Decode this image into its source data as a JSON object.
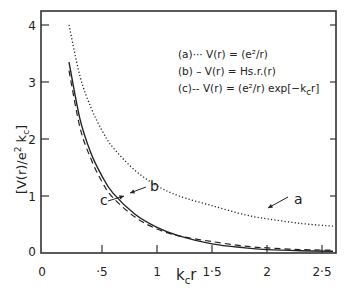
{
  "chart_data": {
    "type": "line",
    "title": "",
    "xlabel": "k_c r",
    "ylabel": "[V(r)/e² k_c]",
    "xlim": [
      0,
      2.63
    ],
    "ylim": [
      0,
      4.3
    ],
    "x_ticks": [
      0,
      0.5,
      1,
      1.5,
      2,
      2.5
    ],
    "x_tick_labels": [
      "0",
      "·5",
      "1",
      "1·5",
      "2",
      "2·5"
    ],
    "y_ticks": [
      0,
      1,
      2,
      3,
      4
    ],
    "y_tick_labels": [
      "0",
      "1",
      "2",
      "3",
      "4"
    ],
    "grid": false,
    "legend_position": "upper right (inside)",
    "legend": [
      {
        "key": "(a)",
        "style": "dotted",
        "label": "V(r) = (e²/r)"
      },
      {
        "key": "(b)",
        "style": "solid",
        "label": "V(r) = Hs.r.(r)"
      },
      {
        "key": "(c)",
        "style": "dashed",
        "label": "V(r) = (e²/r) exp[−k_c r]"
      }
    ],
    "annotations": [
      {
        "text": "a",
        "points_to": "series a",
        "at": [
          1.85,
          0.75
        ]
      },
      {
        "text": "b",
        "points_to": "series b",
        "at": [
          1.0,
          0.62
        ]
      },
      {
        "text": "c",
        "points_to": "series c",
        "at": [
          0.55,
          0.35
        ]
      }
    ],
    "series": [
      {
        "name": "a",
        "style": "dotted",
        "x": [
          0.2,
          0.3,
          0.4,
          0.5,
          0.6,
          0.8,
          1.0,
          1.2,
          1.5,
          1.8,
          2.0,
          2.3,
          2.6
        ],
        "y": [
          4.0,
          3.1,
          2.55,
          2.15,
          1.85,
          1.45,
          1.18,
          1.0,
          0.83,
          0.67,
          0.6,
          0.52,
          0.47
        ]
      },
      {
        "name": "b",
        "style": "solid",
        "x": [
          0.2,
          0.3,
          0.4,
          0.5,
          0.6,
          0.8,
          1.0,
          1.2,
          1.5,
          1.8,
          2.0,
          2.3,
          2.6
        ],
        "y": [
          3.35,
          2.35,
          1.75,
          1.35,
          1.05,
          0.68,
          0.45,
          0.3,
          0.16,
          0.09,
          0.06,
          0.04,
          0.03
        ]
      },
      {
        "name": "c",
        "style": "dashed",
        "x": [
          0.2,
          0.3,
          0.4,
          0.5,
          0.6,
          0.8,
          1.0,
          1.2,
          1.5,
          1.8,
          2.0,
          2.3,
          2.6
        ],
        "y": [
          3.2,
          2.2,
          1.65,
          1.25,
          0.97,
          0.63,
          0.42,
          0.3,
          0.2,
          0.12,
          0.09,
          0.06,
          0.05
        ]
      }
    ]
  },
  "legend_text": {
    "a": "(a)··· V(r) = (e²/r)",
    "b": "(b) –  V(r) = Hs.r.(r)",
    "c": "(c)-- V(r) = (e²/r) exp[−k",
    "c_sub": "c",
    "c_tail": "r]"
  },
  "axis_text": {
    "ylabel_main": "[V(r)/e",
    "ylabel_sup": "2",
    "ylabel_tail": " k",
    "ylabel_sub": "c",
    "ylabel_close": "]",
    "xlabel_main": "k",
    "xlabel_sub": "c",
    "xlabel_tail": "r"
  }
}
